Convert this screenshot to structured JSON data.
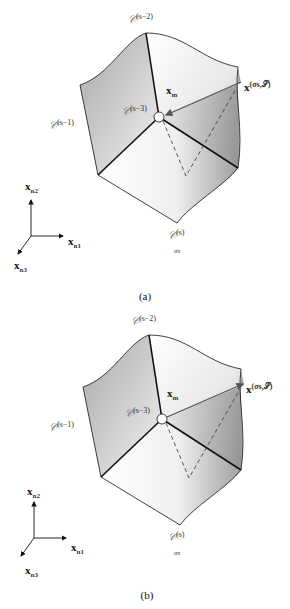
{
  "figure": {
    "panels": [
      {
        "caption": "(a)",
        "arrow_direction": "toward-center",
        "labels": {
          "c_s2": {
            "base": "𝒞",
            "sup": "(s−2)"
          },
          "c_s1": {
            "base": "𝒞",
            "sup": "(s−1)"
          },
          "c_s3": {
            "base": "𝒞",
            "sup": "(s−3)"
          },
          "c_sigma": {
            "base": "𝒞",
            "sup": "(s)",
            "sub": "σs"
          },
          "x_m": {
            "base": "x",
            "sub": "m"
          },
          "x_sigma": {
            "base": "x",
            "sup": "(σs,𝒮)"
          }
        },
        "axes": {
          "x1": {
            "base": "x",
            "sub": "n1"
          },
          "x2": {
            "base": "x",
            "sub": "n2"
          },
          "x3": {
            "base": "x",
            "sub": "n3"
          }
        }
      },
      {
        "caption": "(b)",
        "arrow_direction": "away-from-center",
        "labels": {
          "c_s2": {
            "base": "𝒞",
            "sup": "(s−2)"
          },
          "c_s1": {
            "base": "𝒞",
            "sup": "(s−1)"
          },
          "c_s3": {
            "base": "𝒞",
            "sup": "(s−3)"
          },
          "c_sigma": {
            "base": "𝒞",
            "sup": "(s)",
            "sub": "σs"
          },
          "x_m": {
            "base": "x",
            "sub": "m"
          },
          "x_sigma": {
            "base": "x",
            "sup": "(σs,𝒮)"
          }
        },
        "axes": {
          "x1": {
            "base": "x",
            "sub": "n1"
          },
          "x2": {
            "base": "x",
            "sub": "n2"
          },
          "x3": {
            "base": "x",
            "sub": "n3"
          }
        }
      }
    ],
    "colors": {
      "edge": "#111111",
      "arrow": "#555555",
      "shade_dark": "#8a8a8a",
      "shade_light": "#ffffff"
    }
  }
}
